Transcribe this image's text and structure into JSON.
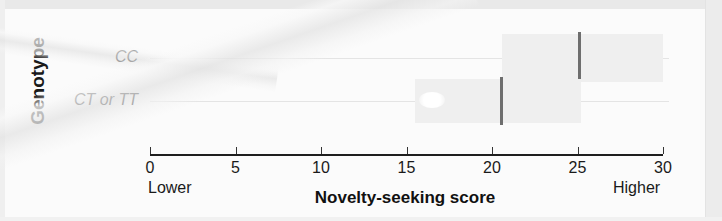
{
  "figure": {
    "type": "forest-plot",
    "y_axis_title": "Genotype",
    "x_axis_title": "Novelty-seeking score",
    "left_anchor_note": "Lower",
    "right_anchor_note": "Higher"
  },
  "chart_data": {
    "type": "bar",
    "title": "",
    "subtitle": "",
    "xlabel": "Novelty-seeking score",
    "ylabel": "Genotype",
    "xlim": [
      0,
      30
    ],
    "xticks": [
      0,
      5,
      10,
      15,
      20,
      25,
      30
    ],
    "xtick_labels": [
      "0",
      "5",
      "10",
      "15",
      "20",
      "25",
      "30"
    ],
    "grid": false,
    "legend": "none",
    "categories": [
      "CC",
      "CT or TT"
    ],
    "values": [
      25.1,
      20.5
    ],
    "series": [
      {
        "name": "Mean novelty-seeking score",
        "values": [
          25.1,
          20.5
        ]
      }
    ],
    "intervals": [
      {
        "category": "CC",
        "estimate": 25.1,
        "low": 20.6,
        "high": 30.0
      },
      {
        "category": "CT or TT",
        "estimate": 20.5,
        "low": 15.5,
        "high": 25.2
      }
    ],
    "annotations": [
      "Lower",
      "Higher"
    ],
    "colors": {
      "interval_band": "#efefef",
      "estimate_marker": "#6e6e6e",
      "axis": "#1e1e1e",
      "row_guide": "#e4e4e4",
      "text": "#1a1a1a",
      "background": "#fbfbfb"
    }
  },
  "rows": [
    {
      "label": "CC",
      "estimate": 25.1,
      "low": 20.6,
      "high": 30.0
    },
    {
      "label": "CT or TT",
      "estimate": 20.5,
      "low": 15.5,
      "high": 25.2
    }
  ],
  "ticks": [
    {
      "label": "0",
      "value": 0
    },
    {
      "label": "5",
      "value": 5
    },
    {
      "label": "10",
      "value": 10
    },
    {
      "label": "15",
      "value": 15
    },
    {
      "label": "20",
      "value": 20
    },
    {
      "label": "25",
      "value": 25
    },
    {
      "label": "30",
      "value": 30
    }
  ]
}
